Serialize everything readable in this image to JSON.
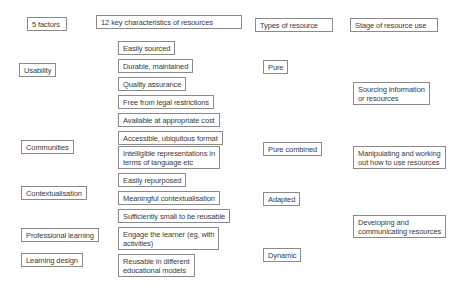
{
  "diagram": {
    "headers": {
      "factors": "5 factors",
      "characteristics": "12 key characteristics of resources",
      "types": "Types of resource",
      "stages": "Stage of resource use"
    },
    "factors": [
      "Usability",
      "Communities",
      "Contextualisation",
      "Professional learning",
      "Learning design"
    ],
    "characteristics": [
      "Easily sourced",
      "Durable, maintained",
      "Quality assurance",
      "Free from legal restrictions",
      "Available at appropriate cost",
      "Accessible, ubiquitous format",
      "Intelligible representations in\nterms of language etc",
      "Easily repurposed",
      "Meaningful contextualisation",
      "Sufficiently small to be reusable",
      "Engage the learner (eg, with\nactivities)",
      "Reusable in different\neducational models"
    ],
    "types": [
      "Pure",
      "Pure combined",
      "Adapted",
      "Dynamic"
    ],
    "stages": [
      "Sourcing information\nor resources",
      "Manipulating and working\nout how to use resources",
      "Developing and\ncommunicating resources"
    ],
    "colors": {
      "border": "#8a8a8a",
      "text": "#3b3b3b",
      "background": "#ffffff"
    }
  }
}
